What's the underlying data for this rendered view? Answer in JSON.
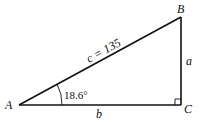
{
  "diagram": {
    "type": "right-triangle",
    "vertices": {
      "A": {
        "label": "A",
        "x": 19,
        "y": 105
      },
      "B": {
        "label": "B",
        "x": 181,
        "y": 17
      },
      "C": {
        "label": "C",
        "x": 181,
        "y": 105
      }
    },
    "sides": {
      "hypotenuse": {
        "label": "c = 135",
        "name": "c",
        "value": 135
      },
      "vertical": {
        "label": "a"
      },
      "horizontal": {
        "label": "b"
      }
    },
    "angle": {
      "vertex": "A",
      "label": "18.6°",
      "value_degrees": 18.6
    },
    "right_angle_at": "C",
    "stroke_color": "#111111"
  }
}
